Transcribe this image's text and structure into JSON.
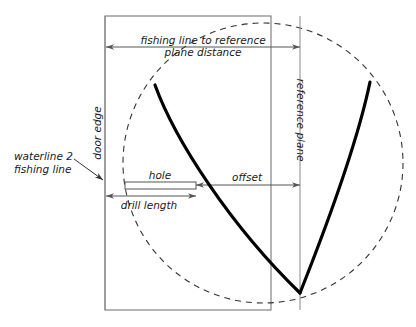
{
  "diagram": {
    "labels": {
      "top_dimension_line1": "fishing line to reference",
      "top_dimension_line2": "plane distance",
      "door_edge": "door edge",
      "reference_plane": "reference plane",
      "waterline_line1": "waterline 2",
      "waterline_line2": "fishing line",
      "hole": "hole",
      "offset": "offset",
      "drill_length": "drill length"
    },
    "colors": {
      "background": "#ffffff",
      "curve": "#000000",
      "dimension": "#555555",
      "thin": "#888888",
      "rect": "#777777",
      "dashed": "#333333",
      "text": "#1a1a1a"
    },
    "geometry": {
      "door_rect": {
        "x": 105,
        "y": 16,
        "width": 166,
        "height": 294
      },
      "dashed_circle": {
        "cx": 263,
        "cy": 163,
        "r": 140
      },
      "reference_plane_line": {
        "x": 300,
        "y1": 16,
        "y2": 310
      },
      "door_edge_line": {
        "x": 105,
        "y1": 16,
        "y2": 310
      },
      "top_dimension": {
        "x1": 106,
        "x2": 300,
        "y": 47
      },
      "offset_dimension": {
        "x1": 196,
        "x2": 300,
        "y": 185
      },
      "drill_dimension": {
        "x1": 106,
        "x2": 196,
        "y": 196
      },
      "hole_rect": {
        "x": 125,
        "y": 182,
        "width": 71,
        "height": 7
      },
      "curve_left": {
        "start_x": 155,
        "start_y": 85,
        "end_x": 300,
        "end_y": 293
      },
      "curve_right": {
        "start_x": 370,
        "start_y": 82,
        "end_x": 300,
        "end_y": 293
      },
      "waterline_arrow": {
        "x1": 78,
        "y1": 161,
        "x2": 104,
        "y2": 180
      }
    }
  }
}
